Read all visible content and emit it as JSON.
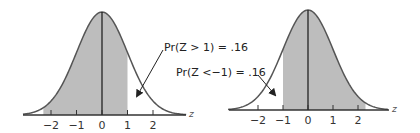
{
  "figures": [
    {
      "id": "left",
      "shaded_region": "z < 1",
      "unshaded_tail": "z > 1",
      "annotation": "Pr(Z > 1) = .16",
      "axis_label": "z",
      "tick_labels": [
        "−2",
        "−1",
        "0",
        "1",
        "2"
      ]
    },
    {
      "id": "right",
      "shaded_region": "z > -1",
      "unshaded_tail": "z < -1",
      "annotation": "Pr(Z <−1) = .16",
      "axis_label": "z",
      "tick_labels": [
        "−2",
        "−1",
        "0",
        "1",
        "2"
      ]
    }
  ],
  "colors": {
    "fill": "#bdbdbd",
    "curve": "#555555",
    "axis": "#333333"
  },
  "chart_data": [
    {
      "type": "area",
      "title": "Standard normal density, shaded below z = 1",
      "xlabel": "z",
      "x_ticks": [
        -2,
        -1,
        0,
        1,
        2
      ],
      "shaded_interval": [
        -3,
        1
      ],
      "annotation": "Pr(Z > 1) = .16"
    },
    {
      "type": "area",
      "title": "Standard normal density, shaded above z = -1",
      "xlabel": "z",
      "x_ticks": [
        -2,
        -1,
        0,
        1,
        2
      ],
      "shaded_interval": [
        -1,
        3
      ],
      "annotation": "Pr(Z <−1) = .16"
    }
  ]
}
